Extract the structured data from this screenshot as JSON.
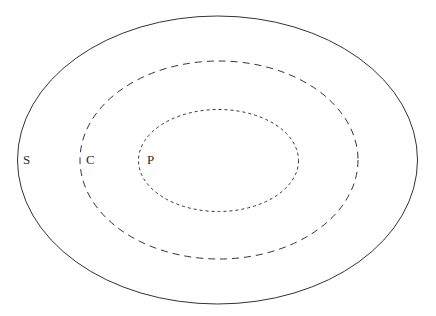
{
  "diagram": {
    "type": "nested-ellipse-set-diagram",
    "background_color": "#ffffff",
    "stroke_color": "#333333",
    "label_color": "#2b2b2b",
    "sets": [
      {
        "id": "outer",
        "label": "S",
        "line_style": "solid",
        "cx": 217.5,
        "cy": 160,
        "rx": 200,
        "ry": 144,
        "label_x": 23,
        "label_y": 161,
        "stroke_width": 1,
        "dash_pattern": "none"
      },
      {
        "id": "middle",
        "label": "C",
        "line_style": "dashed",
        "cx": 219,
        "cy": 160,
        "rx": 139,
        "ry": 99,
        "label_x": 86,
        "label_y": 161,
        "stroke_width": 1,
        "dash_pattern": "7 5"
      },
      {
        "id": "inner",
        "label": "P",
        "line_style": "dotted",
        "cx": 218.5,
        "cy": 160.5,
        "rx": 80,
        "ry": 51,
        "label_x": 147,
        "label_y": 161,
        "stroke_width": 1,
        "dash_pattern": "3 3"
      }
    ]
  },
  "chart_data": {
    "type": "diagram",
    "title": "",
    "categories": [
      "S",
      "C",
      "P"
    ],
    "values": [
      3,
      2,
      1
    ],
    "annotations": [
      "S",
      "C",
      "P"
    ]
  }
}
